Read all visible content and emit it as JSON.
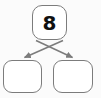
{
  "diagram": {
    "type": "number-bond",
    "background_color": "#fbfbfb",
    "border_color": "#7c7c7c",
    "text_color": "#101010",
    "connector_color": "#7c7c7c",
    "whole": {
      "label": "8",
      "value": "8",
      "filled": true
    },
    "parts": [
      {
        "label": "",
        "value": "",
        "filled": false,
        "position": "left"
      },
      {
        "label": "",
        "value": "",
        "filled": false,
        "position": "right"
      }
    ],
    "connectors": [
      {
        "name": "whole-to-left-part",
        "from": "whole",
        "to": "part-left",
        "arrowhead": "solid-triangle"
      },
      {
        "name": "whole-to-right-part",
        "from": "whole",
        "to": "part-right",
        "arrowhead": "solid-triangle"
      }
    ]
  }
}
